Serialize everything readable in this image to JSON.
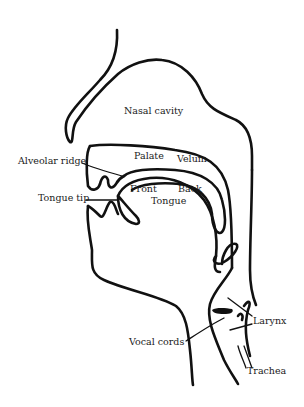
{
  "diagram": {
    "type": "vocal tract cross-section",
    "colors": {
      "line": "#111111",
      "background": "#ffffff",
      "text": "#1a1a1a"
    },
    "labels": {
      "nasal_cavity": "Nasal cavity",
      "alveolar_ridge": "Alveolar ridge",
      "palate": "Palate",
      "velum": "Velum",
      "front": "Front",
      "back": "Back",
      "tongue": "Tongue",
      "tongue_tip": "Tongue tip",
      "vocal_cords": "Vocal cords",
      "larynx": "Larynx",
      "trachea": "Trachea"
    }
  }
}
